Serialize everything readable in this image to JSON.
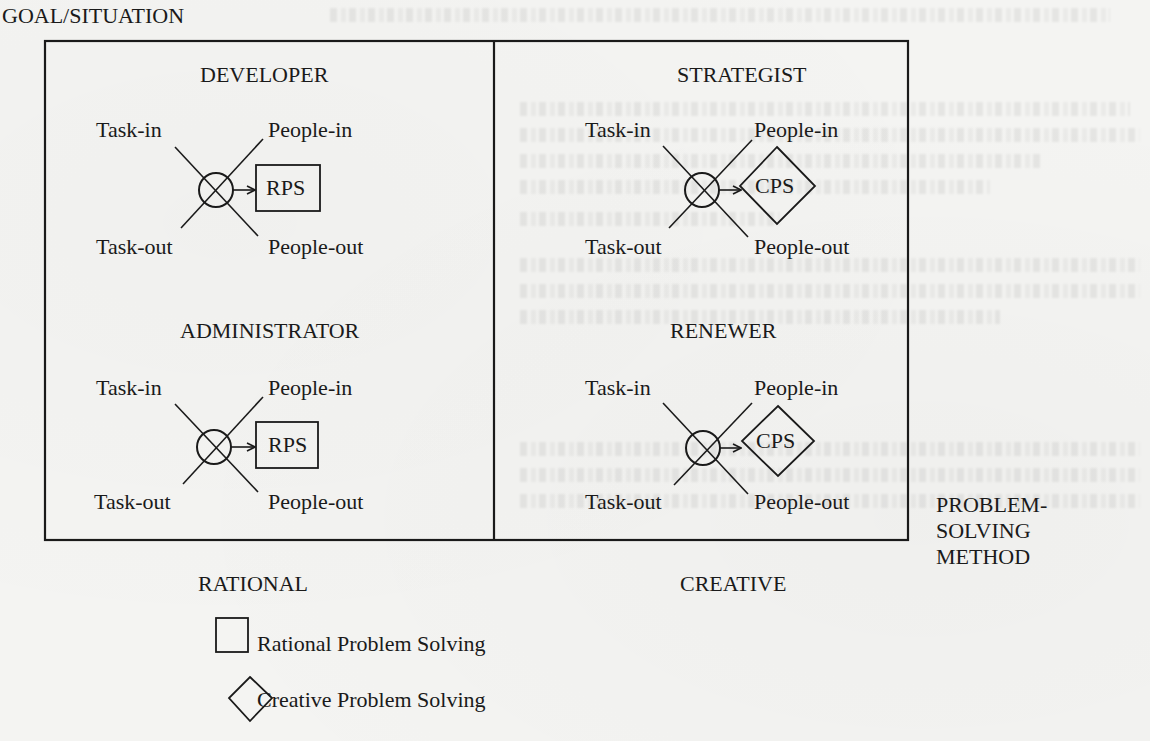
{
  "figure": {
    "axis_labels": {
      "vertical": "GOAL/SITUATION",
      "horizontal_left": "RATIONAL",
      "horizontal_right": "CREATIVE",
      "method": [
        "PROBLEM-",
        "SOLVING",
        "METHOD"
      ]
    },
    "quadrants": [
      {
        "id": "developer",
        "title": "DEVELOPER",
        "method_shape": "square",
        "method_label": "RPS",
        "ports": {
          "task_in": "Task-in",
          "people_in": "People-in",
          "task_out": "Task-out",
          "people_out": "People-out"
        }
      },
      {
        "id": "strategist",
        "title": "STRATEGIST",
        "method_shape": "diamond",
        "method_label": "CPS",
        "ports": {
          "task_in": "Task-in",
          "people_in": "People-in",
          "task_out": "Task-out",
          "people_out": "People-out"
        }
      },
      {
        "id": "administrator",
        "title": "ADMINISTRATOR",
        "method_shape": "square",
        "method_label": "RPS",
        "ports": {
          "task_in": "Task-in",
          "people_in": "People-in",
          "task_out": "Task-out",
          "people_out": "People-out"
        }
      },
      {
        "id": "renewer",
        "title": "RENEWER",
        "method_shape": "diamond",
        "method_label": "CPS",
        "ports": {
          "task_in": "Task-in",
          "people_in": "People-in",
          "task_out": "Task-out",
          "people_out": "People-out"
        }
      }
    ],
    "legend": [
      {
        "shape": "square",
        "label": "Rational Problem Solving"
      },
      {
        "shape": "diamond",
        "label": "Creative Problem Solving"
      }
    ],
    "colors": {
      "ink": "#1a1a1a",
      "paper": "#f4f4f2"
    }
  }
}
